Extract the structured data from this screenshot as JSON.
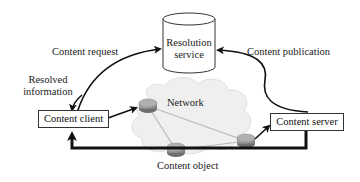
{
  "diagram": {
    "nodes": {
      "resolution_service": {
        "line1": "Resolution",
        "line2": "service",
        "shape": "cylinder"
      },
      "content_client": {
        "label": "Content client",
        "shape": "rectangle"
      },
      "content_server": {
        "label": "Content server",
        "shape": "rectangle"
      },
      "network": {
        "label": "Network",
        "shape": "cloud",
        "routers": 3
      }
    },
    "edges": {
      "content_request": {
        "label": "Content request",
        "from": "content_client",
        "to": "resolution_service"
      },
      "resolved_information": {
        "line1": "Resolved",
        "line2": "information",
        "from": "resolution_service",
        "to": "content_client"
      },
      "content_publication": {
        "label": "Content publication",
        "from": "content_server",
        "to": "resolution_service"
      },
      "content_object": {
        "label": "Content object",
        "from": "content_server",
        "to": "content_client"
      }
    },
    "colors": {
      "stroke": "#111111",
      "cloud_fill": "#eeeeee",
      "router_fill": "#9a9a9a",
      "background": "#ffffff"
    }
  }
}
